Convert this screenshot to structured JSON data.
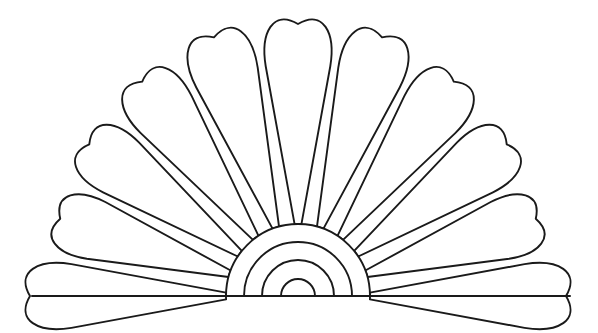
{
  "document": {
    "kind": "coloring-page-line-art",
    "subject": "folding hand fan / scallop shell",
    "background_color": "#ffffff",
    "line_color": "#1a1a1a",
    "line_width": 1.9,
    "width": 598,
    "height": 333,
    "alt_text": "Black and white outline drawing of a folding fan with eleven rounded blades and four concentric arcs at the pivot"
  },
  "figure": {
    "name": "fan",
    "pivot": {
      "cx": 298,
      "cy": 296
    },
    "baseline": {
      "y": 296,
      "x1": 32,
      "x2": 570
    },
    "blade_count": 11,
    "blade_span_degrees": 180,
    "blade_inner_radius": 72,
    "blade_outer_radius": 272,
    "hub": {
      "name": "hub-arcs",
      "arc_count": 4,
      "radii": [
        17,
        36,
        54,
        72
      ]
    },
    "blades": [
      {
        "index": 1,
        "name": "blade-left-1",
        "angle": 180,
        "tip_radius": 268,
        "half_width_deg": 8.0
      },
      {
        "index": 2,
        "name": "blade-left-2",
        "angle": 162,
        "tip_radius": 250,
        "half_width_deg": 8.0
      },
      {
        "index": 3,
        "name": "blade-left-3",
        "angle": 144,
        "tip_radius": 258,
        "half_width_deg": 8.0
      },
      {
        "index": 4,
        "name": "blade-left-4",
        "angle": 126,
        "tip_radius": 265,
        "half_width_deg": 8.0
      },
      {
        "index": 5,
        "name": "blade-left-5",
        "angle": 108,
        "tip_radius": 272,
        "half_width_deg": 8.0
      },
      {
        "index": 6,
        "name": "blade-center",
        "angle": 90,
        "tip_radius": 272,
        "half_width_deg": 8.0
      },
      {
        "index": 7,
        "name": "blade-right-5",
        "angle": 72,
        "tip_radius": 272,
        "half_width_deg": 8.0
      },
      {
        "index": 8,
        "name": "blade-right-4",
        "angle": 54,
        "tip_radius": 265,
        "half_width_deg": 8.0
      },
      {
        "index": 9,
        "name": "blade-right-3",
        "angle": 36,
        "tip_radius": 258,
        "half_width_deg": 8.0
      },
      {
        "index": 10,
        "name": "blade-right-2",
        "angle": 18,
        "tip_radius": 250,
        "half_width_deg": 8.0
      },
      {
        "index": 11,
        "name": "blade-right-1",
        "angle": 0,
        "tip_radius": 268,
        "half_width_deg": 8.0
      }
    ]
  },
  "chart_data": {
    "type": "scatter",
    "title": "",
    "xlabel": "",
    "ylabel": "",
    "note": "Not a data chart; geometric line art. Blade angles in degrees measured CCW from +x axis at the pivot.",
    "categories": [
      "blade-left-1",
      "blade-left-2",
      "blade-left-3",
      "blade-left-4",
      "blade-left-5",
      "blade-center",
      "blade-right-5",
      "blade-right-4",
      "blade-right-3",
      "blade-right-2",
      "blade-right-1"
    ],
    "values": [
      180,
      162,
      144,
      126,
      108,
      90,
      72,
      54,
      36,
      18,
      0
    ]
  }
}
